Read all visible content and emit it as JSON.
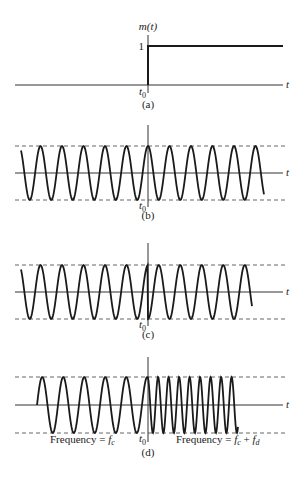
{
  "figure": {
    "t0_x": 148,
    "axis_label": "t",
    "t0_label": "t",
    "t0_sub": "0",
    "colors": {
      "ink": "#1a1a1a",
      "axis": "#333333",
      "dash": "#555555",
      "background": "#ffffff"
    }
  },
  "panels": [
    {
      "id": "a",
      "caption": "(a)",
      "type": "step",
      "signal_label": "m(t)",
      "level_label": "1",
      "axis_y": 85,
      "level_y": 46,
      "vaxis_top": 35,
      "vaxis_bottom": 93,
      "x_start": 15,
      "x_end": 283,
      "step_end": 283,
      "caption_y": 108
    },
    {
      "id": "b",
      "caption": "(b)",
      "type": "carrier",
      "description": "Unmodulated carrier cos(2π f_c t)",
      "axis_y": 173,
      "amp": 27,
      "wave_start": 21,
      "wave_end": 264,
      "period": 21.5,
      "phase_at_t0": 0,
      "phase_shift_after_t0": 0,
      "vaxis_top": 125,
      "vaxis_bottom": 207,
      "caption_y": 219
    },
    {
      "id": "c",
      "caption": "(c)",
      "type": "psk",
      "description": "Carrier with phase shift at t0",
      "axis_y": 292,
      "amp": 27,
      "wave_start": 21,
      "wave_end": 252,
      "period": 21.5,
      "phase_at_t0": 0,
      "phase_shift_after_t0": 3.14159,
      "vaxis_top": 243,
      "vaxis_bottom": 326,
      "caption_y": 338
    },
    {
      "id": "d",
      "caption": "(d)",
      "type": "fsk",
      "description": "Carrier with frequency change at t0",
      "axis_y": 405,
      "amp": 28,
      "wave_start": 37,
      "wave_end": 238,
      "period_before": 21,
      "period_after": 10.5,
      "vaxis_top": 357,
      "vaxis_bottom": 442,
      "caption_y": 456,
      "label_left": {
        "text": "Frequency = ",
        "sym": "f",
        "sub": "c"
      },
      "label_right": {
        "text": "Frequency = ",
        "sym1": "f",
        "sub1": "c",
        "plus": " + ",
        "sym2": "f",
        "sub2": "d"
      }
    }
  ]
}
